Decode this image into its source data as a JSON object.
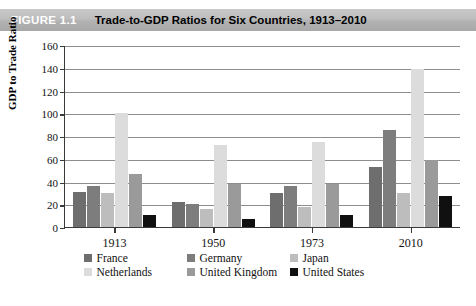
{
  "header": {
    "badge": "FIGURE 1.1",
    "title": "Trade-to-GDP Ratios for Six Countries, 1913–2010"
  },
  "chart_data": {
    "type": "bar",
    "title": "Trade-to-GDP Ratios for Six Countries, 1913–2010",
    "xlabel": "",
    "ylabel": "GDP to Trade Ratio",
    "ylim": [
      0,
      160
    ],
    "ytick_step": 20,
    "yticks": [
      160,
      140,
      120,
      100,
      80,
      60,
      40,
      20,
      0
    ],
    "grid": true,
    "legend_position": "bottom",
    "categories": [
      "1913",
      "1950",
      "1973",
      "2010"
    ],
    "series": [
      {
        "name": "France",
        "color": "#6e6e6e",
        "values": [
          31,
          22,
          30,
          53
        ]
      },
      {
        "name": "Germany",
        "color": "#7d7d7d",
        "values": [
          36,
          20,
          36,
          85
        ]
      },
      {
        "name": "Japan",
        "color": "#bdbdbd",
        "values": [
          30,
          16,
          18,
          30
        ]
      },
      {
        "name": "Netherlands",
        "color": "#dcdcdc",
        "values": [
          100,
          72,
          75,
          139
        ]
      },
      {
        "name": "United Kingdom",
        "color": "#9a9a9a",
        "values": [
          47,
          38,
          38,
          59
        ]
      },
      {
        "name": "United States",
        "color": "#101010",
        "values": [
          11,
          7,
          11,
          27
        ]
      }
    ]
  },
  "legend": {
    "rows": [
      [
        {
          "label": "France",
          "color": "#6e6e6e"
        },
        {
          "label": "Germany",
          "color": "#7d7d7d"
        },
        {
          "label": "Japan",
          "color": "#bdbdbd"
        }
      ],
      [
        {
          "label": "Netherlands",
          "color": "#dcdcdc"
        },
        {
          "label": "United Kingdom",
          "color": "#9a9a9a"
        },
        {
          "label": "United States",
          "color": "#101010"
        }
      ]
    ]
  }
}
